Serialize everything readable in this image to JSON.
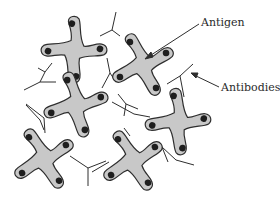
{
  "diagram": {
    "labels": {
      "antigen": "Antigen",
      "antibodies": "Antibodies"
    },
    "colors": {
      "antigen_fill": "#c8c8c8",
      "antigen_stroke": "#2e2e2e",
      "epitope_dot": "#1e1e1e",
      "antibody_line": "#2e2e2e",
      "text": "#2a2a2a"
    },
    "nodes": [
      {
        "id": "antigen-1",
        "type": "antigen",
        "cx": 74,
        "cy": 50,
        "rotation": 20
      },
      {
        "id": "antigen-2",
        "type": "antigen",
        "cx": 143,
        "cy": 65,
        "rotation": -5
      },
      {
        "id": "antigen-3",
        "type": "antigen",
        "cx": 76,
        "cy": 105,
        "rotation": 5
      },
      {
        "id": "antigen-4",
        "type": "antigen",
        "cx": 178,
        "cy": 122,
        "rotation": 15
      },
      {
        "id": "antigen-5",
        "type": "antigen",
        "cx": 44,
        "cy": 159,
        "rotation": 0
      },
      {
        "id": "antigen-6",
        "type": "antigen",
        "cx": 133,
        "cy": 161,
        "rotation": 0
      }
    ],
    "annotations": [
      {
        "label": "Antigen",
        "points_to": "antigen-2"
      },
      {
        "label": "Antibodies",
        "points_to": "antibody"
      }
    ]
  }
}
